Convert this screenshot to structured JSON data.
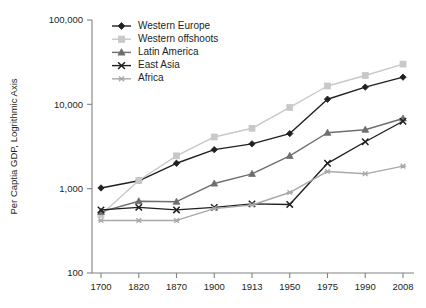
{
  "chart_data": {
    "type": "line",
    "title": "",
    "xlabel": "",
    "ylabel": "Per Captia GDP, Logrithmic Axis",
    "categories": [
      "1700",
      "1820",
      "1870",
      "1900",
      "1913",
      "1950",
      "1975",
      "1990",
      "2008"
    ],
    "yticks": [
      100,
      1000,
      10000,
      100000
    ],
    "ytick_labels": [
      "100",
      "1,000",
      "10,000",
      "100,000"
    ],
    "ylim": [
      100,
      100000
    ],
    "yscale": "log",
    "grid": false,
    "legend_position": "top-left-inside",
    "series": [
      {
        "name": "Western Europe",
        "color": "#231f20",
        "marker": "diamond",
        "values": [
          1020,
          1240,
          2000,
          2900,
          3400,
          4500,
          11500,
          16000,
          21000
        ]
      },
      {
        "name": "Western offshoots",
        "color": "#c8c8c8",
        "marker": "square",
        "values": [
          490,
          1250,
          2450,
          4100,
          5200,
          9200,
          16500,
          22000,
          30000
        ]
      },
      {
        "name": "Latin America",
        "color": "#6d6e71",
        "marker": "triangle",
        "values": [
          530,
          710,
          700,
          1150,
          1500,
          2450,
          4600,
          5000,
          6800
        ]
      },
      {
        "name": "East Asia",
        "color": "#231f20",
        "marker": "x",
        "values": [
          560,
          600,
          560,
          600,
          660,
          650,
          2000,
          3600,
          6300
        ]
      },
      {
        "name": "Africa",
        "color": "#a7a9ac",
        "marker": "asterisk",
        "values": [
          420,
          420,
          420,
          580,
          640,
          900,
          1600,
          1500,
          1850
        ]
      }
    ]
  }
}
